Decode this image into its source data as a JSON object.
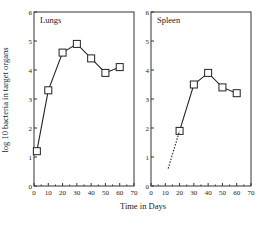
{
  "chart_data": [
    {
      "type": "line",
      "title": "Lungs",
      "xlabel": "Time in Days",
      "ylabel": "log 10 bacteria in target organs",
      "xlim": [
        0,
        70
      ],
      "ylim": [
        0,
        6
      ],
      "xticks": [
        0,
        10,
        20,
        30,
        40,
        50,
        60,
        70
      ],
      "yticks": [
        0,
        1,
        2,
        3,
        4,
        5,
        6
      ],
      "grid": false,
      "marker": "square",
      "series": [
        {
          "name": "Lungs",
          "x": [
            2,
            10,
            20,
            30,
            40,
            50,
            60
          ],
          "values": [
            1.2,
            3.3,
            4.6,
            4.9,
            4.4,
            3.9,
            4.1
          ]
        }
      ]
    },
    {
      "type": "line",
      "title": "Spleen",
      "xlabel": "Time in Days",
      "ylabel": "log 10 bacteria in target organs",
      "xlim": [
        0,
        70
      ],
      "ylim": [
        0,
        6
      ],
      "xticks": [
        0,
        10,
        20,
        30,
        40,
        50,
        60,
        70
      ],
      "yticks": [
        0,
        1,
        2,
        3,
        4,
        5,
        6
      ],
      "grid": false,
      "marker": "square",
      "series": [
        {
          "name": "Spleen",
          "x": [
            20,
            30,
            40,
            50,
            60
          ],
          "values": [
            1.9,
            3.5,
            3.9,
            3.4,
            3.2
          ]
        },
        {
          "name": "Spleen (extrapolated)",
          "style": "dashed",
          "x": [
            12,
            20
          ],
          "values": [
            0.6,
            1.9
          ]
        }
      ]
    }
  ],
  "labels": {
    "panel1": "Lungs",
    "panel2": "Spleen",
    "xlabel": "Time in Days",
    "ylabel": "log 10 bacteria in target organs"
  }
}
